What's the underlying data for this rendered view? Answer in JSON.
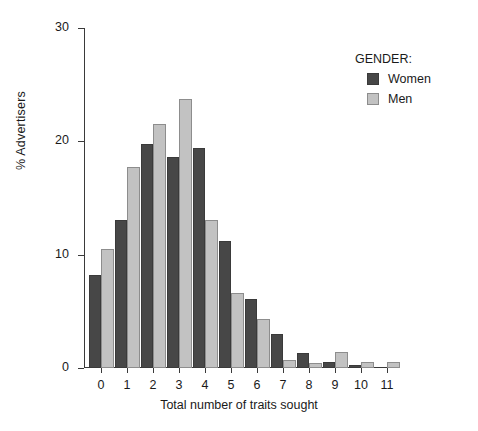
{
  "chart_data": {
    "type": "bar",
    "title": "",
    "xlabel": "Total number of traits sought",
    "ylabel": "% Advertisers",
    "categories": [
      "0",
      "1",
      "2",
      "3",
      "4",
      "5",
      "6",
      "7",
      "8",
      "9",
      "10",
      "11"
    ],
    "series": [
      {
        "name": "Women",
        "color": "#474747",
        "values": [
          8.2,
          13.1,
          19.8,
          18.6,
          19.4,
          11.2,
          6.1,
          3.0,
          1.3,
          0.5,
          0.3,
          0.0
        ]
      },
      {
        "name": "Men",
        "color": "#c2c2c2",
        "values": [
          10.5,
          17.7,
          21.5,
          23.7,
          13.1,
          6.6,
          4.3,
          0.7,
          0.4,
          1.4,
          0.5,
          0.5
        ]
      }
    ],
    "ylim": [
      0,
      30
    ],
    "yticks": [
      0,
      10,
      20,
      30
    ],
    "ytick_labels": [
      "0",
      "10",
      "20",
      "30"
    ],
    "grid": false,
    "legend": {
      "title": "GENDER:",
      "position": "top-right",
      "entries": [
        "Women",
        "Men"
      ]
    }
  }
}
